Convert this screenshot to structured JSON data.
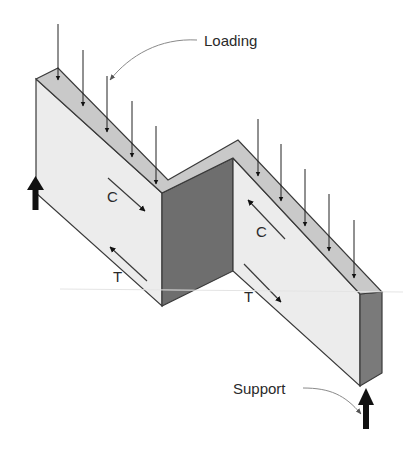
{
  "diagram": {
    "labels": {
      "loading": "Loading",
      "support": "Support",
      "compression_left": "C",
      "tension_left": "T",
      "compression_right": "C",
      "tension_right": "T"
    },
    "load_arrows": {
      "left_segment_count": 5,
      "right_segment_count": 5
    },
    "supports": {
      "count": 2,
      "positions": [
        "left-end",
        "right-end"
      ]
    },
    "colors": {
      "top_face": "#c9c9c9",
      "front_face": "#ececec",
      "dark_face": "#6e6e6e",
      "end_face": "#7a7a7a",
      "edge": "#3a3a3a",
      "arrow": "#111111",
      "leader": "#8a8a8a"
    }
  }
}
